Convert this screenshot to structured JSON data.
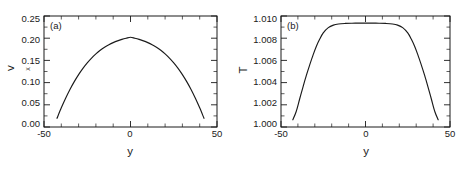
{
  "figure": {
    "background": "#ffffff",
    "foreground": "#1a1a1a"
  },
  "panels": [
    {
      "id": "a",
      "label": "(a)",
      "xlabel": "y",
      "ylabel_main": "v",
      "ylabel_sub": "x",
      "xticklabels": [
        "-50",
        "0",
        "50"
      ],
      "yticklabels": [
        "0.00",
        "0.05",
        "0.10",
        "0.15",
        "0.20",
        "0.25"
      ]
    },
    {
      "id": "b",
      "label": "(b)",
      "xlabel": "y",
      "ylabel_main": "T",
      "ylabel_sub": "",
      "xticklabels": [
        "-50",
        "0",
        "50"
      ],
      "yticklabels": [
        "1.000",
        "1.002",
        "1.004",
        "1.006",
        "1.008",
        "1.010"
      ]
    }
  ],
  "chart_data": [
    {
      "type": "line",
      "panel": "a",
      "title": "(a)",
      "xlabel": "y",
      "ylabel": "v_x",
      "xlim": [
        -50,
        50
      ],
      "ylim": [
        0.0,
        0.25
      ],
      "xticks": [
        -50,
        0,
        50
      ],
      "yticks": [
        0.0,
        0.05,
        0.1,
        0.15,
        0.2,
        0.25
      ],
      "xminorticks": 5,
      "yminorticks": 5,
      "grid": false,
      "legend": null,
      "series": [
        {
          "name": "velocity profile",
          "color": "#1a1a1a",
          "x": [
            -42.5,
            -40,
            -37.5,
            -35,
            -32.5,
            -30,
            -27.5,
            -25,
            -22.5,
            -20,
            -17.5,
            -15,
            -12.5,
            -10,
            -7.5,
            -5,
            -2.5,
            0,
            2.5,
            5,
            7.5,
            10,
            12.5,
            15,
            17.5,
            20,
            22.5,
            25,
            27.5,
            30,
            32.5,
            35,
            37.5,
            40,
            42.5
          ],
          "y": [
            0.0195,
            0.0432,
            0.0648,
            0.0845,
            0.1022,
            0.118,
            0.132,
            0.1444,
            0.1552,
            0.1646,
            0.1727,
            0.1795,
            0.1852,
            0.19,
            0.194,
            0.1973,
            0.2,
            0.2022,
            0.2,
            0.1973,
            0.194,
            0.19,
            0.1852,
            0.1795,
            0.1727,
            0.1646,
            0.1552,
            0.1444,
            0.132,
            0.118,
            0.1022,
            0.0845,
            0.0648,
            0.0432,
            0.0195
          ]
        }
      ]
    },
    {
      "type": "line",
      "panel": "b",
      "title": "(b)",
      "xlabel": "y",
      "ylabel": "T",
      "xlim": [
        -50,
        50
      ],
      "ylim": [
        1.0,
        1.01
      ],
      "xticks": [
        -50,
        0,
        50
      ],
      "yticks": [
        1.0,
        1.002,
        1.004,
        1.006,
        1.008,
        1.01
      ],
      "xminorticks": 5,
      "yminorticks": 4,
      "grid": false,
      "legend": null,
      "series": [
        {
          "name": "temperature profile",
          "color": "#1a1a1a",
          "x": [
            -43,
            -41,
            -39,
            -37,
            -35,
            -33,
            -31,
            -29,
            -27,
            -25,
            -22,
            -19,
            -16,
            -12,
            -8,
            -4,
            0,
            4,
            8,
            12,
            16,
            19,
            22,
            25,
            27,
            29,
            31,
            33,
            35,
            37,
            39,
            41,
            43
          ],
          "y": [
            1.00065,
            1.0014,
            1.0025,
            1.0036,
            1.00465,
            1.0056,
            1.0065,
            1.0073,
            1.00795,
            1.00848,
            1.00895,
            1.00918,
            1.00928,
            1.00933,
            1.00935,
            1.00936,
            1.00936,
            1.00936,
            1.00935,
            1.00933,
            1.00928,
            1.00918,
            1.00895,
            1.00848,
            1.00795,
            1.0073,
            1.0065,
            1.0056,
            1.00465,
            1.0036,
            1.0025,
            1.0014,
            1.00065
          ]
        }
      ]
    }
  ]
}
